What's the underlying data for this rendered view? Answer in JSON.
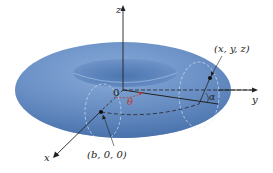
{
  "diagram": {
    "type": "torus-coordinate-diagram",
    "colors": {
      "torus_light": "#a9c2e3",
      "torus_mid": "#6f94c9",
      "torus_dark": "#3f6aa6",
      "axis": "#222222",
      "theta_accent": "#c0392b",
      "guide_circle": "#dce8f5"
    },
    "axes": {
      "z_label": "z",
      "y_label": "y",
      "x_label": "x",
      "origin_label": "0"
    },
    "angles": {
      "theta_label": "θ",
      "alpha_label": "α"
    },
    "points": [
      {
        "label": "(x, y, z)"
      },
      {
        "label": "(b, 0, 0)"
      }
    ]
  }
}
